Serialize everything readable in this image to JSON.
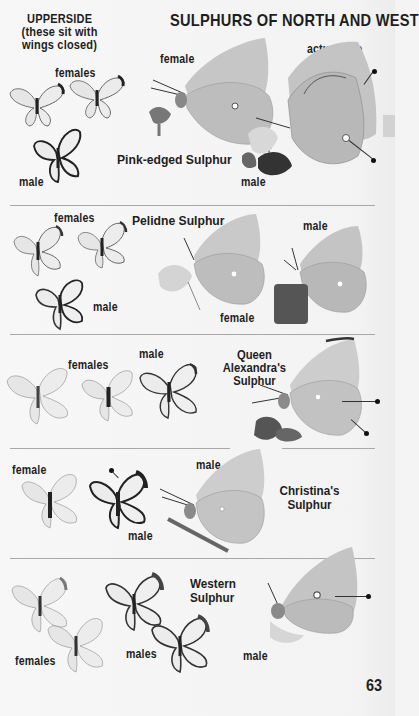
{
  "page": {
    "title": "SULPHURS OF NORTH AND WEST",
    "upperside_heading": [
      "UPPERSIDE",
      "(these sit with",
      "wings closed)"
    ],
    "actual_size_label": "actual size",
    "page_number": "63",
    "colors": {
      "background": "#f4f4f4",
      "text": "#1e1e1e",
      "divider": "#a8a8a8",
      "butterfly_wing": "#c9c9c9",
      "butterfly_wing_light": "#e2e2e2",
      "butterfly_edge": "#2a2a2a"
    }
  },
  "sections": [
    {
      "species": "Pink-edged Sulphur",
      "labels": {
        "uppers_a": "females",
        "uppers_b": "male",
        "side_a": "female",
        "side_b": "male"
      }
    },
    {
      "species": "Pelidne Sulphur",
      "labels": {
        "uppers_a": "females",
        "uppers_b": "male",
        "side_a": "female",
        "side_b": "male"
      }
    },
    {
      "species_lines": [
        "Queen",
        "Alexandra's",
        "Sulphur"
      ],
      "labels": {
        "uppers_a": "females",
        "uppers_b": "male"
      }
    },
    {
      "species_lines": [
        "Christina's",
        "Sulphur"
      ],
      "labels": {
        "uppers_a": "female",
        "uppers_b": "male",
        "side_a": "male"
      }
    },
    {
      "species_lines": [
        "Western",
        "Sulphur"
      ],
      "labels": {
        "uppers_a": "females",
        "uppers_b": "males",
        "side_a": "male"
      }
    }
  ]
}
